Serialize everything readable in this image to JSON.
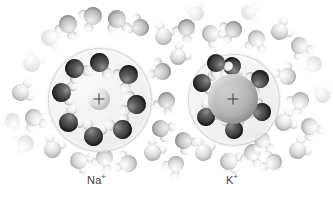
{
  "figure": {
    "type": "molecular-diagram",
    "background_color": "#ffffff"
  },
  "ions": [
    {
      "id": "sodium",
      "label_text": "Na",
      "charge": "+",
      "center": {
        "x": 99,
        "y": 99
      },
      "core_radius": 11,
      "core_color": "#e2e2e2",
      "shell_radius": 51,
      "shell_color": "#eeeeee",
      "inner_shell_waters": 8,
      "label_pos": {
        "x": 87,
        "y": 172
      }
    },
    {
      "id": "potassium",
      "label_text": "K",
      "charge": "+",
      "center": {
        "x": 233,
        "y": 99
      },
      "core_radius": 25,
      "core_color": "#b0b0b0",
      "shell_radius": 45,
      "shell_color": "#ededed",
      "inner_shell_waters": 7,
      "label_pos": {
        "x": 226,
        "y": 172
      }
    }
  ],
  "molecule_colors": {
    "oxygen_dark": "#2e2e2e",
    "oxygen_mid": "#ababab",
    "oxygen_light": "#c9c9c9",
    "hydrogen": "#efefef"
  },
  "inner_waters_na": [
    {
      "x": 99,
      "y": 62,
      "s": 19,
      "rot": 185
    },
    {
      "x": 128,
      "y": 74,
      "s": 19,
      "rot": 235
    },
    {
      "x": 136,
      "y": 104,
      "s": 19,
      "rot": 285
    },
    {
      "x": 122,
      "y": 129,
      "s": 19,
      "rot": 330
    },
    {
      "x": 93,
      "y": 136,
      "s": 19,
      "rot": 15
    },
    {
      "x": 68,
      "y": 122,
      "s": 19,
      "rot": 55
    },
    {
      "x": 61,
      "y": 92,
      "s": 19,
      "rot": 100
    },
    {
      "x": 74,
      "y": 68,
      "s": 19,
      "rot": 140
    }
  ],
  "inner_waters_k": [
    {
      "x": 232,
      "y": 66,
      "s": 18,
      "rot": 190
    },
    {
      "x": 260,
      "y": 79,
      "s": 18,
      "rot": 245
    },
    {
      "x": 262,
      "y": 112,
      "s": 18,
      "rot": 300
    },
    {
      "x": 234,
      "y": 130,
      "s": 18,
      "rot": 355
    },
    {
      "x": 206,
      "y": 117,
      "s": 18,
      "rot": 40
    },
    {
      "x": 202,
      "y": 83,
      "s": 18,
      "rot": 95
    },
    {
      "x": 216,
      "y": 63,
      "s": 18,
      "rot": 145
    }
  ],
  "bulk_waters": [
    {
      "x": 31,
      "y": 63,
      "s": 17,
      "rot": 30,
      "t": "faint"
    },
    {
      "x": 49,
      "y": 37,
      "s": 17,
      "rot": 110,
      "t": "faint"
    },
    {
      "x": 68,
      "y": 24,
      "s": 18,
      "rot": 200,
      "t": "mid"
    },
    {
      "x": 93,
      "y": 16,
      "s": 18,
      "rot": 240,
      "t": "mid"
    },
    {
      "x": 117,
      "y": 19,
      "s": 18,
      "rot": 170,
      "t": "mid"
    },
    {
      "x": 140,
      "y": 27,
      "s": 17,
      "rot": 300,
      "t": "mid"
    },
    {
      "x": 163,
      "y": 36,
      "s": 17,
      "rot": 20,
      "t": "light"
    },
    {
      "x": 186,
      "y": 27,
      "s": 17,
      "rot": 215,
      "t": "mid"
    },
    {
      "x": 210,
      "y": 33,
      "s": 17,
      "rot": 130,
      "t": "light"
    },
    {
      "x": 233,
      "y": 29,
      "s": 17,
      "rot": 250,
      "t": "mid"
    },
    {
      "x": 256,
      "y": 38,
      "s": 17,
      "rot": 190,
      "t": "light"
    },
    {
      "x": 279,
      "y": 31,
      "s": 17,
      "rot": 60,
      "t": "light"
    },
    {
      "x": 299,
      "y": 45,
      "s": 17,
      "rot": 150,
      "t": "light"
    },
    {
      "x": 314,
      "y": 64,
      "s": 16,
      "rot": 265,
      "t": "faint"
    },
    {
      "x": 20,
      "y": 92,
      "s": 17,
      "rot": 75,
      "t": "light"
    },
    {
      "x": 33,
      "y": 117,
      "s": 17,
      "rot": 160,
      "t": "light"
    },
    {
      "x": 25,
      "y": 143,
      "s": 17,
      "rot": 250,
      "t": "faint"
    },
    {
      "x": 52,
      "y": 149,
      "s": 17,
      "rot": 25,
      "t": "light"
    },
    {
      "x": 78,
      "y": 160,
      "s": 17,
      "rot": 115,
      "t": "light"
    },
    {
      "x": 104,
      "y": 157,
      "s": 17,
      "rot": 205,
      "t": "light"
    },
    {
      "x": 128,
      "y": 163,
      "s": 17,
      "rot": 290,
      "t": "light"
    },
    {
      "x": 152,
      "y": 152,
      "s": 17,
      "rot": 35,
      "t": "light"
    },
    {
      "x": 160,
      "y": 128,
      "s": 17,
      "rot": 120,
      "t": "mid"
    },
    {
      "x": 166,
      "y": 100,
      "s": 17,
      "rot": 210,
      "t": "mid"
    },
    {
      "x": 162,
      "y": 71,
      "s": 17,
      "rot": 295,
      "t": "mid"
    },
    {
      "x": 178,
      "y": 57,
      "s": 16,
      "rot": 45,
      "t": "light"
    },
    {
      "x": 183,
      "y": 140,
      "s": 17,
      "rot": 135,
      "t": "mid"
    },
    {
      "x": 176,
      "y": 164,
      "s": 16,
      "rot": 225,
      "t": "light"
    },
    {
      "x": 203,
      "y": 152,
      "s": 17,
      "rot": 15,
      "t": "light"
    },
    {
      "x": 228,
      "y": 161,
      "s": 17,
      "rot": 105,
      "t": "light"
    },
    {
      "x": 252,
      "y": 152,
      "s": 17,
      "rot": 195,
      "t": "light"
    },
    {
      "x": 274,
      "y": 162,
      "s": 16,
      "rot": 285,
      "t": "light"
    },
    {
      "x": 297,
      "y": 150,
      "s": 17,
      "rot": 55,
      "t": "light"
    },
    {
      "x": 309,
      "y": 126,
      "s": 17,
      "rot": 145,
      "t": "light"
    },
    {
      "x": 300,
      "y": 100,
      "s": 17,
      "rot": 235,
      "t": "light"
    },
    {
      "x": 287,
      "y": 76,
      "s": 17,
      "rot": 325,
      "t": "light"
    },
    {
      "x": 283,
      "y": 122,
      "s": 17,
      "rot": 65,
      "t": "light"
    },
    {
      "x": 262,
      "y": 140,
      "s": 16,
      "rot": 175,
      "t": "light"
    },
    {
      "x": 196,
      "y": 13,
      "s": 15,
      "rot": 340,
      "t": "faint"
    },
    {
      "x": 248,
      "y": 12,
      "s": 15,
      "rot": 95,
      "t": "faint"
    },
    {
      "x": 12,
      "y": 120,
      "s": 15,
      "rot": 200,
      "t": "faint"
    },
    {
      "x": 322,
      "y": 95,
      "s": 15,
      "rot": 10,
      "t": "faint"
    }
  ]
}
